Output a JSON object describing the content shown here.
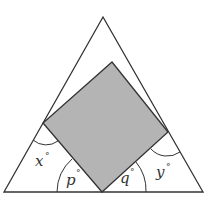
{
  "diagram": {
    "colors": {
      "stroke": "#333333",
      "square_fill": "#b4b4b4",
      "background": "#ffffff"
    },
    "triangle": {
      "apex": [
        103,
        17
      ],
      "bottom_left": [
        4,
        192
      ],
      "bottom_right": [
        203,
        192
      ]
    },
    "square": {
      "top": [
        112,
        62
      ],
      "right": [
        168,
        132
      ],
      "bottom": [
        102,
        192
      ],
      "left": [
        43,
        123
      ]
    },
    "angles": [
      {
        "name": "x",
        "label": "x",
        "unit": "°"
      },
      {
        "name": "p",
        "label": "p",
        "unit": "°"
      },
      {
        "name": "q",
        "label": "q",
        "unit": "°"
      },
      {
        "name": "y",
        "label": "y",
        "unit": "°"
      }
    ]
  }
}
